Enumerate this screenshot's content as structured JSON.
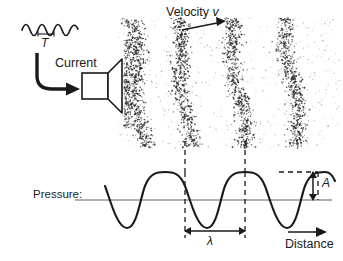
{
  "diagram": {
    "labels": {
      "current": "Current",
      "velocity": "Velocity",
      "velocity_symbol": "v",
      "period_symbol": "T",
      "pressure": "Pressure:",
      "distance": "Distance",
      "amplitude_symbol": "A",
      "wavelength_symbol": "λ"
    },
    "colors": {
      "ink": "#1a1a1a",
      "axis": "#b0b0b0",
      "particles": "#2b2b2b",
      "background": "#ffffff"
    },
    "icons": {
      "speaker": "speaker-icon",
      "current_arrow": "curved-arrow-icon",
      "velocity_arrow": "arrow-right-icon",
      "distance_arrow": "arrow-right-icon",
      "amplitude_arrow": "double-arrow-vertical-icon",
      "wavelength_arrow": "double-arrow-horizontal-icon",
      "ac_signal": "sine-wave-icon"
    }
  },
  "chart_data": {
    "type": "line",
    "xlabel": "Distance",
    "ylabel": "Pressure:",
    "grid": false,
    "legend": null,
    "axis_y_value": 0,
    "waveform": {
      "shape": "sine",
      "cycles": 3.5,
      "amplitude_label": "A",
      "wavelength_label": "λ",
      "peaks_x": [
        172,
        232,
        292
      ],
      "troughs_x": [
        142,
        202,
        262,
        322
      ],
      "start_x": 105,
      "end_x": 332,
      "baseline_y": 200,
      "amplitude_px": 28
    },
    "compressions": {
      "count": 4,
      "centers_x": [
        137,
        183,
        237,
        292
      ],
      "description": "Dense particle bands aligned with pressure maxima"
    },
    "annotations": [
      {
        "name": "period",
        "text": "T",
        "target": "ac-signal"
      },
      {
        "name": "amplitude",
        "text": "A",
        "target": "wave-peak"
      },
      {
        "name": "wavelength",
        "text": "λ",
        "target": "peak-to-peak"
      },
      {
        "name": "propagation",
        "text": "Velocity v",
        "target": "wave-travel-direction"
      }
    ]
  },
  "ac_signal": {
    "cycles": 4,
    "period_marker": "T"
  }
}
